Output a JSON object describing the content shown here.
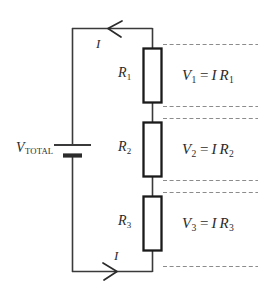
{
  "figure": {
    "type": "series-resistor-circuit-diagram",
    "background_color": "#ffffff",
    "wire_color": "#3a3a3a",
    "resistor_border_color": "#1a1a1a",
    "resistor_fill_color": "#ffffff",
    "dashed_line_color": "#8c8c8c",
    "text_color": "#2b2b2b"
  },
  "source": {
    "label_v": "V",
    "label_total": "TOTAL"
  },
  "current": {
    "top_label": "I",
    "bottom_label": "I",
    "top_arrow_direction": "left",
    "bottom_arrow_direction": "right"
  },
  "resistors": [
    {
      "label_r": "R",
      "index": "1"
    },
    {
      "label_r": "R",
      "index": "2"
    },
    {
      "label_r": "R",
      "index": "3"
    }
  ],
  "equations": [
    {
      "v": "V",
      "v_index": "1",
      "equals": "=",
      "i": "I",
      "r": "R",
      "r_index": "1"
    },
    {
      "v": "V",
      "v_index": "2",
      "equals": "=",
      "i": "I",
      "r": "R",
      "r_index": "2"
    },
    {
      "v": "V",
      "v_index": "3",
      "equals": "=",
      "i": "I",
      "r": "R",
      "r_index": "3"
    }
  ]
}
